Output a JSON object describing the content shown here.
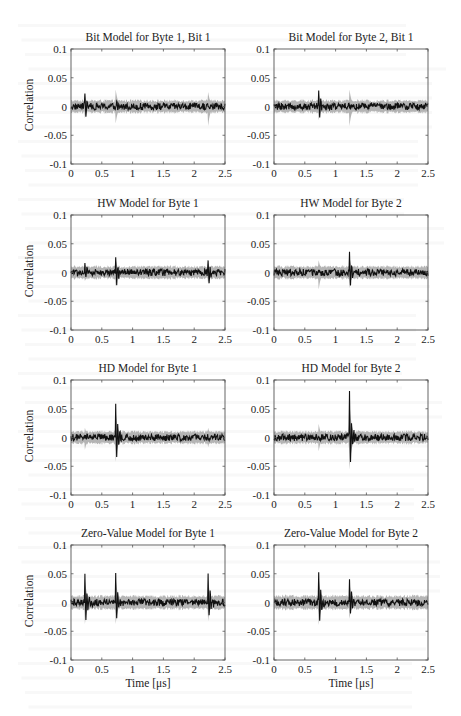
{
  "figure": {
    "axis": {
      "xlim": [
        0,
        2.5
      ],
      "ylim": [
        -0.1,
        0.1
      ],
      "xticks": [
        0,
        0.5,
        1,
        1.5,
        2,
        2.5
      ],
      "xtick_labels": [
        "0",
        "0.5",
        "1",
        "1.5",
        "2",
        "2.5"
      ],
      "yticks": [
        0.1,
        0.05,
        0,
        -0.05,
        -0.1
      ],
      "ytick_labels": [
        "0.1",
        "0.05",
        "0",
        "-0.05",
        "-0.1"
      ],
      "ylabel": "Correlation",
      "xlabel": "Time [μs]"
    },
    "colors": {
      "correct_key_trace": "#111111",
      "other_keys_envelope": "#b4b4b4",
      "axes": "#555555",
      "background": "#ffffff"
    }
  },
  "chart_data": [
    {
      "type": "line",
      "title": "Bit Model for Byte 1, Bit 1",
      "xlabel": "",
      "ylabel": "Correlation",
      "xlim": [
        0,
        2.5
      ],
      "ylim": [
        -0.1,
        0.1
      ],
      "grid": false,
      "legend": "none",
      "baseline_noise": {
        "black": 0.006,
        "gray": 0.01
      },
      "spikes": [
        {
          "t": 0.22,
          "peak_pos": 0.03,
          "peak_neg": -0.03,
          "series": "black"
        },
        {
          "t": 0.72,
          "peak_pos": 0.035,
          "peak_neg": -0.035,
          "series": "gray"
        },
        {
          "t": 0.74,
          "peak_pos": 0.01,
          "peak_neg": -0.015,
          "series": "black"
        },
        {
          "t": 2.22,
          "peak_pos": 0.03,
          "peak_neg": -0.04,
          "series": "gray"
        }
      ]
    },
    {
      "type": "line",
      "title": "Bit Model for Byte 2, Bit 1",
      "xlabel": "",
      "ylabel": "",
      "xlim": [
        0,
        2.5
      ],
      "ylim": [
        -0.1,
        0.1
      ],
      "grid": false,
      "legend": "none",
      "baseline_noise": {
        "black": 0.006,
        "gray": 0.01
      },
      "spikes": [
        {
          "t": 0.72,
          "peak_pos": 0.035,
          "peak_neg": -0.035,
          "series": "black"
        },
        {
          "t": 1.22,
          "peak_pos": 0.035,
          "peak_neg": -0.04,
          "series": "gray"
        }
      ]
    },
    {
      "type": "line",
      "title": "HW Model for Byte 1",
      "xlabel": "",
      "ylabel": "Correlation",
      "xlim": [
        0,
        2.5
      ],
      "ylim": [
        -0.1,
        0.1
      ],
      "grid": false,
      "legend": "none",
      "baseline_noise": {
        "black": 0.006,
        "gray": 0.01
      },
      "spikes": [
        {
          "t": 0.22,
          "peak_pos": 0.022,
          "peak_neg": -0.022,
          "series": "black"
        },
        {
          "t": 0.72,
          "peak_pos": 0.035,
          "peak_neg": -0.035,
          "series": "black"
        },
        {
          "t": 2.22,
          "peak_pos": 0.025,
          "peak_neg": -0.03,
          "series": "black"
        }
      ]
    },
    {
      "type": "line",
      "title": "HW Model for Byte 2",
      "xlabel": "",
      "ylabel": "",
      "xlim": [
        0,
        2.5
      ],
      "ylim": [
        -0.1,
        0.1
      ],
      "grid": false,
      "legend": "none",
      "baseline_noise": {
        "black": 0.006,
        "gray": 0.01
      },
      "spikes": [
        {
          "t": 0.72,
          "peak_pos": 0.025,
          "peak_neg": -0.035,
          "series": "gray"
        },
        {
          "t": 1.22,
          "peak_pos": 0.042,
          "peak_neg": -0.04,
          "series": "black"
        }
      ]
    },
    {
      "type": "line",
      "title": "HD Model for Byte 1",
      "xlabel": "",
      "ylabel": "Correlation",
      "xlim": [
        0,
        2.5
      ],
      "ylim": [
        -0.1,
        0.1
      ],
      "grid": false,
      "legend": "none",
      "baseline_noise": {
        "black": 0.006,
        "gray": 0.01
      },
      "spikes": [
        {
          "t": 0.22,
          "peak_pos": 0.02,
          "peak_neg": -0.025,
          "series": "gray"
        },
        {
          "t": 0.72,
          "peak_pos": 0.068,
          "peak_neg": -0.062,
          "series": "black"
        },
        {
          "t": 2.22,
          "peak_pos": 0.02,
          "peak_neg": -0.02,
          "series": "gray"
        }
      ]
    },
    {
      "type": "line",
      "title": "HD Model for Byte 2",
      "xlabel": "",
      "ylabel": "",
      "xlim": [
        0,
        2.5
      ],
      "ylim": [
        -0.1,
        0.1
      ],
      "grid": false,
      "legend": "none",
      "baseline_noise": {
        "black": 0.006,
        "gray": 0.01
      },
      "spikes": [
        {
          "t": 0.72,
          "peak_pos": 0.028,
          "peak_neg": -0.028,
          "series": "gray"
        },
        {
          "t": 1.22,
          "peak_pos": 0.092,
          "peak_neg": -0.082,
          "series": "black"
        }
      ]
    },
    {
      "type": "line",
      "title": "Zero-Value Model for Byte 1",
      "xlabel": "Time [μs]",
      "ylabel": "Correlation",
      "xlim": [
        0,
        2.5
      ],
      "ylim": [
        -0.1,
        0.1
      ],
      "grid": false,
      "legend": "none",
      "baseline_noise": {
        "black": 0.006,
        "gray": 0.011
      },
      "spikes": [
        {
          "t": 0.22,
          "peak_pos": 0.06,
          "peak_neg": -0.055,
          "series": "black"
        },
        {
          "t": 0.72,
          "peak_pos": 0.062,
          "peak_neg": -0.055,
          "series": "black"
        },
        {
          "t": 2.22,
          "peak_pos": 0.06,
          "peak_neg": -0.048,
          "series": "black"
        }
      ]
    },
    {
      "type": "line",
      "title": "Zero-Value Model for Byte 2",
      "xlabel": "Time [μs]",
      "ylabel": "",
      "xlim": [
        0,
        2.5
      ],
      "ylim": [
        -0.1,
        0.1
      ],
      "grid": false,
      "legend": "none",
      "baseline_noise": {
        "black": 0.006,
        "gray": 0.011
      },
      "spikes": [
        {
          "t": 0.72,
          "peak_pos": 0.065,
          "peak_neg": -0.058,
          "series": "black"
        },
        {
          "t": 1.22,
          "peak_pos": 0.05,
          "peak_neg": -0.042,
          "series": "black"
        }
      ]
    }
  ]
}
